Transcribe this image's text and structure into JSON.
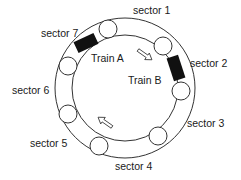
{
  "diagram": {
    "track": {
      "center": [
        125,
        88
      ],
      "outer_radius": 70,
      "inner_radius": 53,
      "stroke": "#333333"
    },
    "sectors": [
      {
        "label": "sector 1",
        "pos": [
          133,
          4
        ]
      },
      {
        "label": "sector 2",
        "pos": [
          190,
          58
        ]
      },
      {
        "label": "sector 3",
        "pos": [
          187,
          118
        ]
      },
      {
        "label": "sector 4",
        "pos": [
          115,
          161
        ]
      },
      {
        "label": "sector 5",
        "pos": [
          30,
          138
        ]
      },
      {
        "label": "sector 6",
        "pos": [
          12,
          85
        ]
      },
      {
        "label": "sector 7",
        "pos": [
          41,
          28
        ]
      }
    ],
    "trains": [
      {
        "label": "Train A",
        "pos": [
          91,
          52
        ]
      },
      {
        "label": "Train B",
        "pos": [
          128,
          75
        ]
      }
    ]
  }
}
